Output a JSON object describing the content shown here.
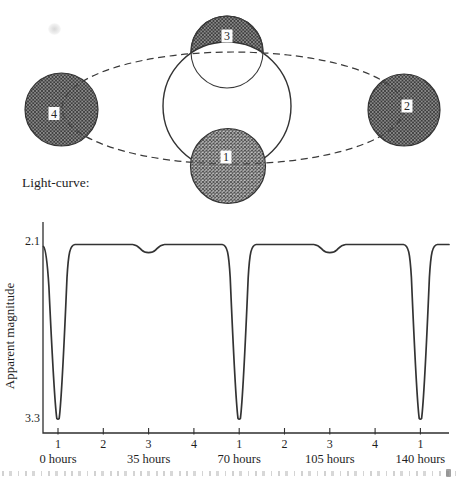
{
  "figure": {
    "caption_label": "Light-curve:",
    "colors": {
      "line": "#2f2f2f",
      "hatch_fill": "#c3c3c3",
      "hatch_stroke": "#3d3d3d",
      "background": "#ffffff"
    }
  },
  "orbit_diagram": {
    "stars": {
      "position1": {
        "label": "1",
        "place": "bottom, small star in front of large star"
      },
      "position2": {
        "label": "2",
        "place": "right end of orbit"
      },
      "position3": {
        "label": "3",
        "place": "top, small star partly behind large star"
      },
      "position4": {
        "label": "4",
        "place": "left end of orbit"
      }
    }
  },
  "chart_data": {
    "type": "line",
    "title": "Light-curve:",
    "ylabel": "Apparent magnitude",
    "y_ticks": [
      "2.1",
      "3.3"
    ],
    "y_axis_note": "magnitude scale runs downward: 2.1 (bright) at top, 3.3 (faint) at bottom",
    "x_ticks": [
      {
        "label": "1",
        "hours": 0
      },
      {
        "label": "2",
        "hours": 17.5
      },
      {
        "label": "3",
        "hours": 35
      },
      {
        "label": "4",
        "hours": 52.5
      },
      {
        "label": "1",
        "hours": 70
      },
      {
        "label": "2",
        "hours": 87.5
      },
      {
        "label": "3",
        "hours": 105
      },
      {
        "label": "4",
        "hours": 122.5
      },
      {
        "label": "1",
        "hours": 140
      }
    ],
    "x_hour_labels": [
      {
        "label": "0 hours",
        "hours": 0
      },
      {
        "label": "35 hours",
        "hours": 35
      },
      {
        "label": "70 hours",
        "hours": 70
      },
      {
        "label": "105 hours",
        "hours": 105
      },
      {
        "label": "140 hours",
        "hours": 140
      }
    ],
    "baseline_magnitude": 2.1,
    "period_hours": 70,
    "eclipse_events": [
      {
        "hours": 0,
        "type": "primary",
        "at_position": "1",
        "magnitude": 3.3
      },
      {
        "hours": 35,
        "type": "secondary",
        "at_position": "3",
        "magnitude": 2.16
      },
      {
        "hours": 70,
        "type": "primary",
        "at_position": "1",
        "magnitude": 3.3
      },
      {
        "hours": 105,
        "type": "secondary",
        "at_position": "3",
        "magnitude": 2.16
      },
      {
        "hours": 140,
        "type": "primary",
        "at_position": "1",
        "magnitude": 3.3
      }
    ]
  }
}
